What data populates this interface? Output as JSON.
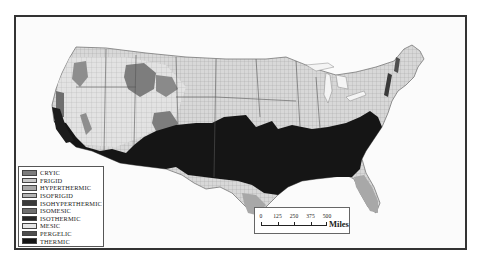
{
  "map": {
    "subject": "Soil temperature regimes of the conterminous United States",
    "colors": {
      "frame": "#333333",
      "background": "#fbfbfb",
      "land_default": "#d9d9d9",
      "county_lines": "#9a9a9a"
    }
  },
  "legend": {
    "items": [
      {
        "label": "CRYIC",
        "color": "#7d7d7d"
      },
      {
        "label": "FRIGID",
        "color": "#c8c8c8"
      },
      {
        "label": "HYPERTHERMIC",
        "color": "#a8a8a8"
      },
      {
        "label": "ISOFRIGID",
        "color": "#b4b4b4"
      },
      {
        "label": "ISOHYPERTHERMIC",
        "color": "#3a3a3a"
      },
      {
        "label": "ISOMESIC",
        "color": "#6e6e6e"
      },
      {
        "label": "ISOTHERMIC",
        "color": "#262626"
      },
      {
        "label": "MESIC",
        "color": "#e6e6e6"
      },
      {
        "label": "PERGELIC",
        "color": "#4e4e4e"
      },
      {
        "label": "THERMIC",
        "color": "#151515"
      }
    ]
  },
  "scalebar": {
    "ticks": [
      "0",
      "125",
      "250",
      "375",
      "500"
    ],
    "unit": "Miles"
  }
}
